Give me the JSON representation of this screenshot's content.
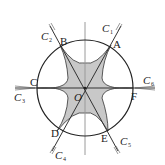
{
  "diagram": {
    "type": "geometry-figure",
    "colors": {
      "stroke": "#222222",
      "fill": "#c8c8c8",
      "axis": "#9a9a9a"
    },
    "points": [
      {
        "name": "A",
        "label": "A"
      },
      {
        "name": "B",
        "label": "B"
      },
      {
        "name": "C",
        "label": "C"
      },
      {
        "name": "D",
        "label": "D"
      },
      {
        "name": "E",
        "label": "E"
      },
      {
        "name": "F",
        "label": "F"
      },
      {
        "name": "O",
        "label": "O"
      }
    ],
    "curves": [
      {
        "label": "C",
        "sub": "1"
      },
      {
        "label": "C",
        "sub": "2"
      },
      {
        "label": "C",
        "sub": "3"
      },
      {
        "label": "C",
        "sub": "4"
      },
      {
        "label": "C",
        "sub": "5"
      },
      {
        "label": "C",
        "sub": "6"
      }
    ]
  }
}
